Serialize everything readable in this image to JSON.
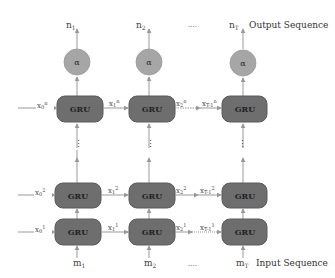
{
  "diagram": {
    "colors": {
      "gru_fill": "#6e6e6e",
      "gru_stroke": "#5a5a5a",
      "alpha_fill": "#a6a6a6",
      "line": "#999999",
      "text": "#444444"
    },
    "output_label": "Output Sequence",
    "input_label": "Input Sequence",
    "ellipsis": "....",
    "vertical_ellipsis": "⋮",
    "gru_label": "GRU",
    "alpha_label": "α",
    "columns": [
      {
        "output": "n₁",
        "input": "m₁",
        "top_left_state": "x₀ⁿ",
        "mid_left_state": "x₀²",
        "bot_left_state": "x₀¹"
      },
      {
        "output": "n₂",
        "input": "m₂",
        "top_left_state": "x₁ⁿ",
        "mid_left_state": "x₁²",
        "bot_left_state": "x₁¹"
      },
      {
        "output": "n_T",
        "input": "m_T",
        "top_left_state": "x_{T-1}ⁿ",
        "mid_left_state": "x_{T-1}²",
        "bot_left_state": "x_{T-1}¹"
      }
    ],
    "between_states": {
      "top": "x₂ⁿ",
      "mid": "x₂²",
      "bot": "x₂¹"
    }
  },
  "labels": {
    "n1": "n",
    "n1_sub": "1",
    "n2": "n",
    "n2_sub": "2",
    "nT": "n",
    "nT_sub": "T",
    "m1": "m",
    "m1_sub": "1",
    "m2": "m",
    "m2_sub": "2",
    "mT": "m",
    "mT_sub": "T",
    "x0n": "x",
    "x0n_sub": "0",
    "x0n_sup": "n",
    "x1n": "x",
    "x1n_sub": "1",
    "x1n_sup": "n",
    "x2n": "x",
    "x2n_sub": "2",
    "x2n_sup": "n",
    "xTn": "x",
    "xTn_sub": "T-1",
    "xTn_sup": "n",
    "x02": "x",
    "x02_sub": "0",
    "x02_sup": "2",
    "x12": "x",
    "x12_sub": "1",
    "x12_sup": "2",
    "x22": "x",
    "x22_sub": "2",
    "x22_sup": "2",
    "xT2": "x",
    "xT2_sub": "T-1",
    "xT2_sup": "2",
    "x01": "x",
    "x01_sub": "0",
    "x01_sup": "1",
    "x11": "x",
    "x11_sub": "1",
    "x11_sup": "1",
    "x21": "x",
    "x21_sub": "2",
    "x21_sup": "1",
    "xT1": "x",
    "xT1_sub": "T-1",
    "xT1_sup": "1",
    "dots_top": "....",
    "dots_bottom": "....",
    "dots_mid_row1": "....",
    "dots_mid_row3": "....",
    "vdots": "⋮",
    "gru": "GRU",
    "alpha": "α",
    "output_sequence": "Output Sequence",
    "input_sequence": "Input Sequence"
  }
}
